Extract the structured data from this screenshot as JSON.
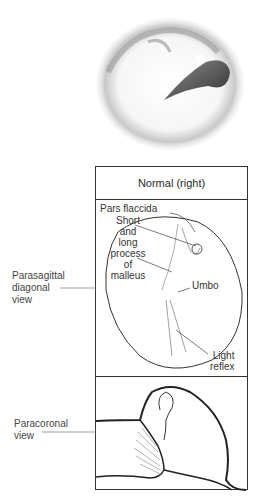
{
  "figure": {
    "photo_alt": "Otoscopic view of normal right tympanic membrane",
    "header": "Normal (right)",
    "parasagittal_panel": {
      "labels": {
        "pars_flaccida": "Pars flaccida",
        "malleus_l1": "Short",
        "malleus_l2": "and",
        "malleus_l3": "long",
        "malleus_l4": "process",
        "malleus_l5": "of",
        "malleus_l6": "malleus",
        "umbo": "Umbo",
        "light_l1": "Light",
        "light_l2": "reflex"
      }
    },
    "side_labels": {
      "parasagittal_l1": "Parasagittal",
      "parasagittal_l2": "diagonal",
      "parasagittal_l3": "view",
      "paracoronal_l1": "Paracoronal",
      "paracoronal_l2": "view"
    }
  }
}
